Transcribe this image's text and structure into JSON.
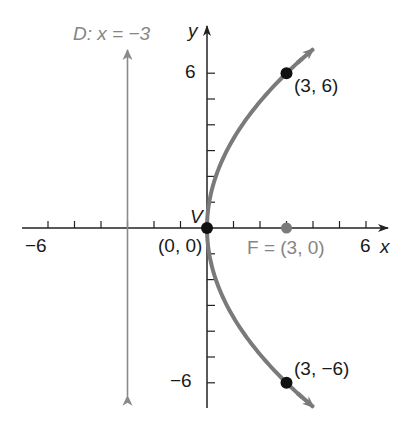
{
  "chart_data": {
    "type": "line",
    "title": "",
    "xlabel": "x",
    "ylabel": "y",
    "xlim": [
      -7,
      7
    ],
    "ylim": [
      -7,
      7
    ],
    "grid": false,
    "x_ticks": [
      -6,
      -5,
      -4,
      -3,
      -2,
      -1,
      1,
      2,
      3,
      4,
      5,
      6
    ],
    "y_ticks": [
      -6,
      -5,
      -4,
      -3,
      -2,
      -1,
      1,
      2,
      3,
      4,
      5,
      6
    ],
    "x_tick_labels": [
      {
        "value": -6,
        "label": "−6"
      },
      {
        "value": 6,
        "label": "6"
      }
    ],
    "y_tick_labels": [
      {
        "value": 6,
        "label": "6"
      },
      {
        "value": -6,
        "label": "−6"
      }
    ],
    "series": [
      {
        "name": "Parabola y^2 = 12x",
        "equation": "y^2 = 12x",
        "color": "#7a7a7a",
        "x": [
          3.75,
          3,
          2.0833,
          1.3333,
          0.75,
          0.3333,
          0.0833,
          0,
          0.0833,
          0.3333,
          0.75,
          1.3333,
          2.0833,
          3,
          3.75
        ],
        "y": [
          6.7082,
          6,
          5,
          4,
          3,
          2,
          1,
          0,
          -1,
          -2,
          -3,
          -4,
          -5,
          -6,
          -6.7082
        ]
      },
      {
        "name": "Directrix",
        "equation": "x = -3",
        "color": "#8a8a8a",
        "x": [
          -3,
          -3
        ],
        "y": [
          -6.5,
          6.9
        ]
      }
    ],
    "points": [
      {
        "name": "vertex",
        "label": "V",
        "coord_label": "(0, 0)",
        "x": 0,
        "y": 0,
        "color": "#111111"
      },
      {
        "name": "focus",
        "label": "F = (3, 0)",
        "x": 3,
        "y": 0,
        "color": "#7a7a7a"
      },
      {
        "name": "upper-point",
        "label": "(3, 6)",
        "x": 3,
        "y": 6,
        "color": "#111111"
      },
      {
        "name": "lower-point",
        "label": "(3, −6)",
        "x": 3,
        "y": -6,
        "color": "#111111"
      }
    ],
    "annotations": [
      {
        "text": "D: x = −3",
        "target": "directrix"
      }
    ]
  },
  "labels": {
    "directrix": "D: x = −3",
    "x_axis": "x",
    "y_axis": "y",
    "x_tick_neg6": "−6",
    "x_tick_6": "6",
    "y_tick_6": "6",
    "y_tick_neg6": "−6",
    "vertex_letter": "V",
    "vertex_coord": "(0, 0)",
    "focus": "F = (3, 0)",
    "upper_point": "(3, 6)",
    "lower_point": "(3, −6)"
  }
}
